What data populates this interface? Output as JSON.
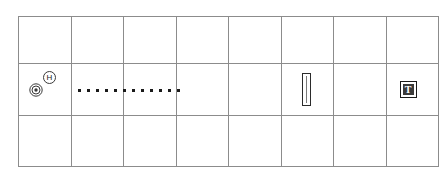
{
  "diagram": {
    "background_color": "#ffffff",
    "grid": {
      "columns": 8,
      "rows": 3,
      "line_color": "#8c8c8c",
      "left": 18,
      "top": 16,
      "width": 412,
      "row_heights": [
        47,
        52,
        51
      ]
    },
    "markers": [
      {
        "id": "helipad",
        "icon": "circled-h-icon",
        "label": "H",
        "row": 2,
        "column": 1,
        "color": "#1a1a1a"
      },
      {
        "id": "bullseye",
        "icon": "concentric-circles-icon",
        "label": "",
        "row": 2,
        "column": 1,
        "color": "#3a3a3a"
      },
      {
        "id": "dotted-path",
        "icon": "dotted-line-icon",
        "label": "",
        "row": 2,
        "column": 2,
        "dot_count": 12,
        "color": "#1a1a1a"
      },
      {
        "id": "column-post",
        "icon": "vertical-column-icon",
        "label": "",
        "row": 2,
        "column": 6,
        "color": "#2b2b2b"
      },
      {
        "id": "tee-marker",
        "icon": "boxed-t-icon",
        "label": "T",
        "row": 2,
        "column": 8,
        "color": "#3a3a3a"
      }
    ]
  }
}
